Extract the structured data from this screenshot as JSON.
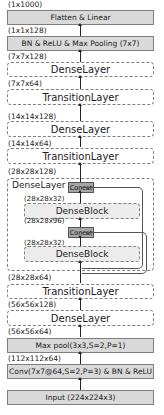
{
  "diagram": {
    "layers": [
      {
        "id": "flatten",
        "label": "Flatten & Linear",
        "output_shape": "(1x1000)",
        "style": "solid"
      },
      {
        "id": "bn_relu_pool",
        "label": "BN & ReLU & Max Pooling (7x7)",
        "output_shape": "(1x1x128)",
        "style": "solid"
      },
      {
        "id": "dense4",
        "label": "DenseLayer",
        "output_shape": "(7x7x128)",
        "style": "dashed"
      },
      {
        "id": "trans3",
        "label": "TransitionLayer",
        "output_shape": "(7x7x64)",
        "style": "dashed"
      },
      {
        "id": "dense3",
        "label": "DenseLayer",
        "output_shape": "(14x14x128)",
        "style": "dashed"
      },
      {
        "id": "trans2",
        "label": "TransitionLayer",
        "output_shape": "(14x14x64)",
        "style": "dashed"
      },
      {
        "id": "dense2",
        "label": "DenseLayer",
        "output_shape": "(28x28x128)",
        "style": "dashed-expanded"
      },
      {
        "id": "trans1",
        "label": "TransitionLayer",
        "output_shape": "(28x28x64)",
        "style": "dashed"
      },
      {
        "id": "dense1",
        "label": "DenseLayer",
        "output_shape": "(56x56x128)",
        "style": "dashed"
      },
      {
        "id": "maxpool",
        "label": "Max pool(3x3,S=2,P=1)",
        "output_shape": "(56x56x64)",
        "style": "solid"
      },
      {
        "id": "conv",
        "label": "Conv(7x7@64,S=2,P=3) & BN &  ReLU",
        "output_shape": "(112x112x64)",
        "style": "solid"
      },
      {
        "id": "input",
        "label": "Input (224x224x3)",
        "style": "solid"
      }
    ],
    "expanded_dense_layer": {
      "title": "DenseLayer",
      "concat_label": "Concat",
      "block_label": "DenseBlock",
      "inner_shapes": [
        "(28x28x32)",
        "(28x28x96)",
        "(28x28x32)"
      ]
    }
  }
}
